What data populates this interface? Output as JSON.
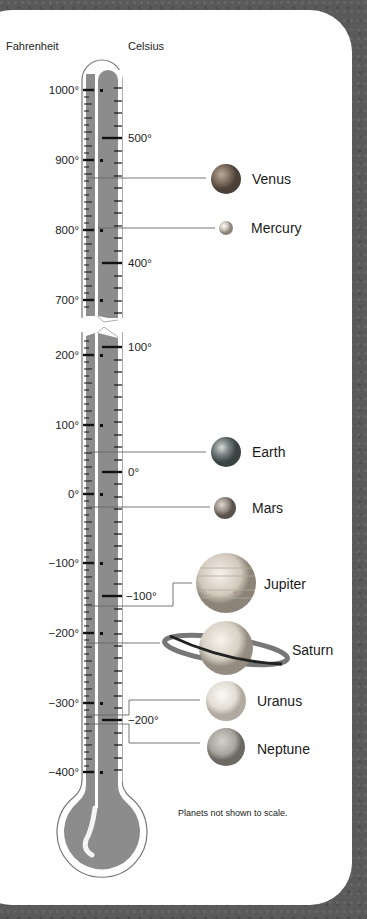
{
  "headers": {
    "fahrenheit": "Fahrenheit",
    "celsius": "Celsius"
  },
  "fahrenheit_labels": [
    {
      "label": "1000°",
      "y": 90
    },
    {
      "label": "900°",
      "y": 160
    },
    {
      "label": "800°",
      "y": 230
    },
    {
      "label": "700°",
      "y": 300
    },
    {
      "label": "200°",
      "y": 355
    },
    {
      "label": "100°",
      "y": 425
    },
    {
      "label": "0°",
      "y": 494
    },
    {
      "label": "−100°",
      "y": 563
    },
    {
      "label": "−200°",
      "y": 633
    },
    {
      "label": "−300°",
      "y": 703
    },
    {
      "label": "−400°",
      "y": 772
    }
  ],
  "celsius_labels": [
    {
      "label": "500°",
      "y": 138
    },
    {
      "label": "400°",
      "y": 263
    },
    {
      "label": "100°",
      "y": 347
    },
    {
      "label": "0°",
      "y": 472
    },
    {
      "label": "−100°",
      "y": 596
    },
    {
      "label": "−200°",
      "y": 720
    }
  ],
  "planets": [
    {
      "name": "Venus",
      "temp_f": 870,
      "color": "#8a7a6a"
    },
    {
      "name": "Mercury",
      "temp_f": 800,
      "color": "#c8c0b0"
    },
    {
      "name": "Earth",
      "temp_f": 59,
      "color": "#6e7a7a"
    },
    {
      "name": "Mars",
      "temp_f": -20,
      "color": "#9a9088"
    },
    {
      "name": "Jupiter",
      "temp_f": -162,
      "color": "#d8d0c4"
    },
    {
      "name": "Saturn",
      "temp_f": -218,
      "color": "#d8d2c6"
    },
    {
      "name": "Uranus",
      "temp_f": -323,
      "color": "#e2ddd4"
    },
    {
      "name": "Neptune",
      "temp_f": -330,
      "color": "#a8a49e"
    }
  ],
  "note": "Planets not shown to scale.",
  "colors": {
    "mercury_fill": "#8c8c8c",
    "tube_outline": "#777777",
    "card": "#ffffff",
    "background": "#5a5a5a"
  }
}
